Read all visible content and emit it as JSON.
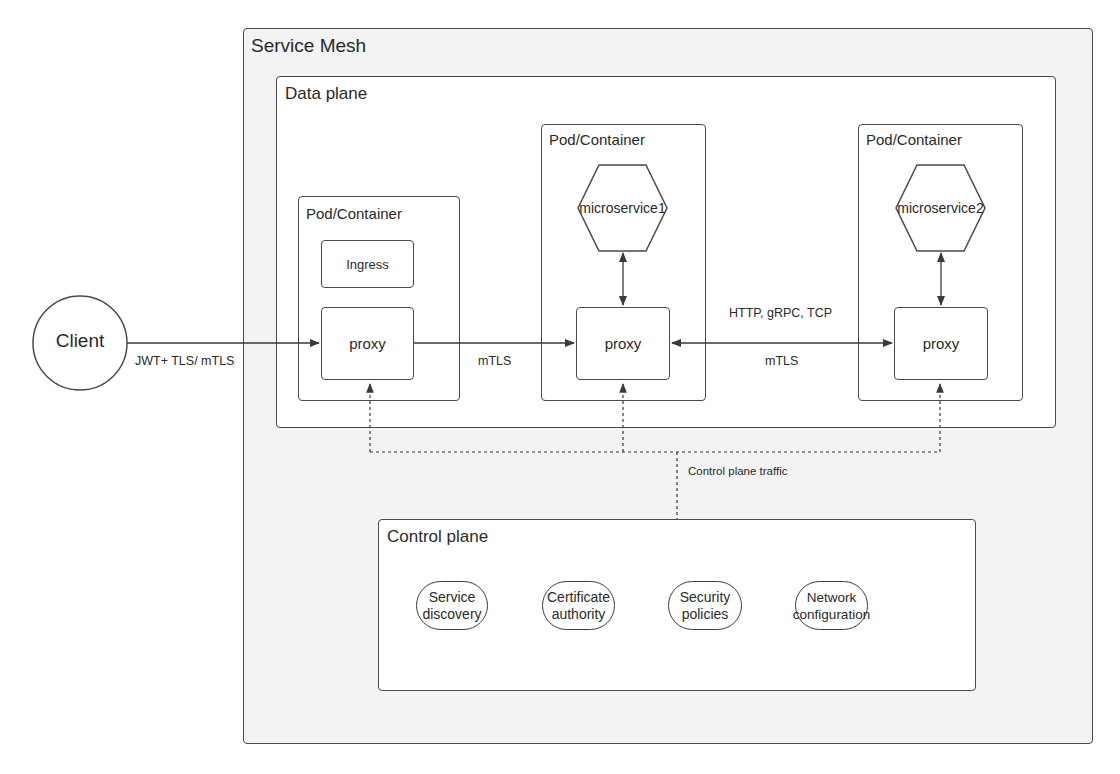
{
  "diagram": {
    "service_mesh": {
      "title": "Service Mesh"
    },
    "data_plane": {
      "title": "Data plane",
      "pods": [
        {
          "title": "Pod/Container",
          "components": [
            "Ingress",
            "proxy"
          ]
        },
        {
          "title": "Pod/Container",
          "service": "microservice1",
          "proxy": "proxy"
        },
        {
          "title": "Pod/Container",
          "service": "microservice2",
          "proxy": "proxy"
        }
      ]
    },
    "client": {
      "label": "Client"
    },
    "edges": {
      "client_to_ingress": "JWT+ TLS/ mTLS",
      "ingress_to_pod1": "mTLS",
      "pod1_to_pod2_top": "HTTP, gRPC, TCP",
      "pod1_to_pod2_bottom": "mTLS",
      "control_traffic": "Control plane traffic"
    },
    "control_plane": {
      "title": "Control plane",
      "components": [
        "Service discovery",
        "Certificate authority",
        "Security policies",
        "Network configuration"
      ],
      "components_lines": [
        [
          "Service",
          "discovery"
        ],
        [
          "Certificate",
          "authority"
        ],
        [
          "Security",
          "policies"
        ],
        [
          "Network",
          "configuration"
        ]
      ]
    },
    "colors": {
      "stroke": "#4a4a4a",
      "mesh_fill": "#f3f3f3",
      "box_fill": "#ffffff"
    }
  }
}
